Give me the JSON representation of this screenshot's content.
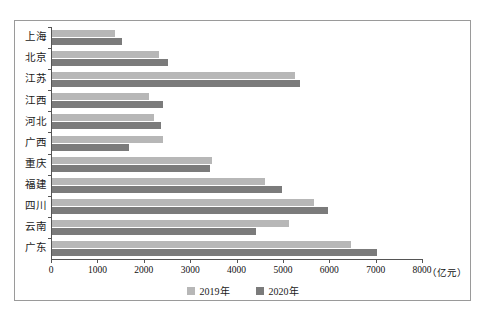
{
  "chart_data": {
    "type": "bar",
    "orientation": "horizontal",
    "title": "",
    "xlabel": "（亿元）",
    "ylabel": "",
    "xlim": [
      0,
      8000
    ],
    "xticks": [
      0,
      1000,
      2000,
      3000,
      4000,
      5000,
      6000,
      7000,
      8000
    ],
    "xtick_labels": [
      "0",
      "1000",
      "2000",
      "3000",
      "4000",
      "5000",
      "6000",
      "7000",
      "8000"
    ],
    "unit_label": "（亿元）",
    "grid": false,
    "legend_position": "bottom-center",
    "categories": [
      "上海",
      "北京",
      "江苏",
      "江西",
      "河北",
      "广西",
      "重庆",
      "福建",
      "四川",
      "云南",
      "广东"
    ],
    "series": [
      {
        "name": "2019年",
        "color": "#b7b7b7",
        "values": [
          1350,
          2300,
          5250,
          2100,
          2200,
          2400,
          3450,
          4600,
          5650,
          5100,
          6450
        ]
      },
      {
        "name": "2020年",
        "color": "#7b7b7b",
        "values": [
          1500,
          2500,
          5350,
          2400,
          2350,
          1650,
          3400,
          4950,
          5950,
          4400,
          7000
        ]
      }
    ]
  }
}
